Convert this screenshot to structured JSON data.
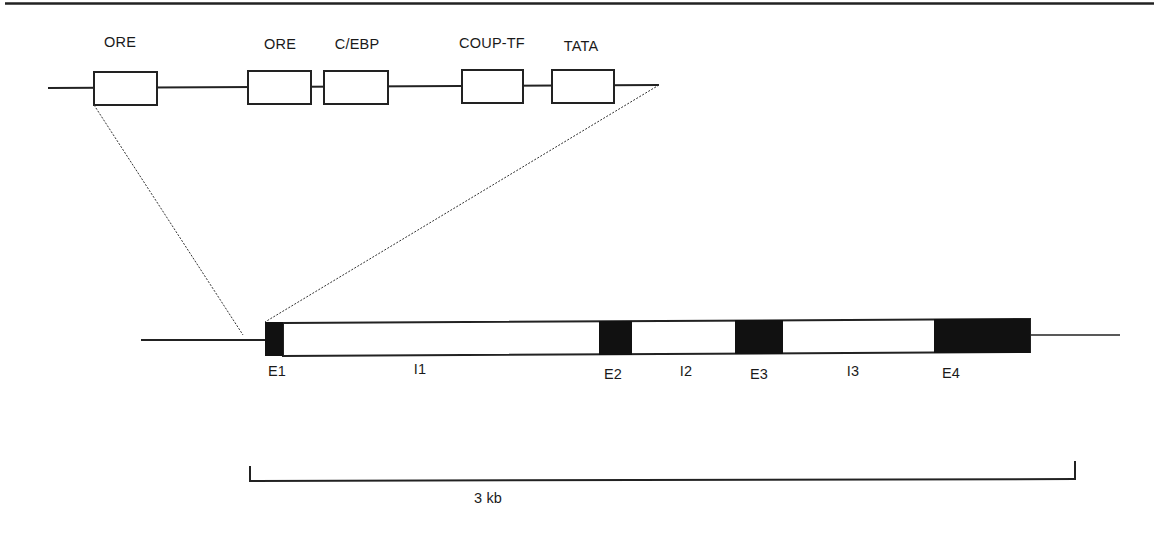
{
  "diagram": {
    "type": "gene-structure",
    "promoter_inset": {
      "elements": [
        {
          "label": "ORE",
          "x": 94,
          "w": 63
        },
        {
          "label": "ORE",
          "x": 248,
          "w": 63
        },
        {
          "label": "C/EBP",
          "x": 324,
          "w": 64
        },
        {
          "label": "COUP-TF",
          "x": 462,
          "w": 61
        },
        {
          "label": "TATA",
          "x": 552,
          "w": 62
        }
      ]
    },
    "gene": {
      "segments": [
        {
          "label": "E1",
          "kind": "exon"
        },
        {
          "label": "I1",
          "kind": "intron"
        },
        {
          "label": "E2",
          "kind": "exon"
        },
        {
          "label": "I2",
          "kind": "intron"
        },
        {
          "label": "E3",
          "kind": "exon"
        },
        {
          "label": "I3",
          "kind": "intron"
        },
        {
          "label": "E4",
          "kind": "exon"
        }
      ]
    },
    "scale_bar": {
      "label": "3 kb"
    }
  },
  "labels": {
    "ore1": "ORE",
    "ore2": "ORE",
    "cebp": "C/EBP",
    "coup": "COUP-TF",
    "tata": "TATA",
    "e1": "E1",
    "i1": "I1",
    "e2": "E2",
    "i2": "I2",
    "e3": "E3",
    "i3": "I3",
    "e4": "E4",
    "scale": "3 kb"
  }
}
